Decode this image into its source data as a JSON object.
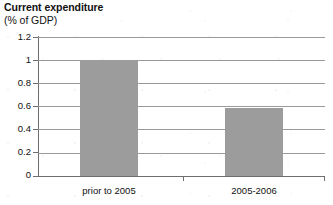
{
  "chart_data": {
    "type": "bar",
    "title": "Current expenditure",
    "subtitle": "(% of GDP)",
    "xlabel": "",
    "ylabel": "",
    "categories": [
      "prior to 2005",
      "2005-2006"
    ],
    "values": [
      1.0,
      0.59
    ],
    "series": [
      {
        "name": "Current expenditure (% of GDP)",
        "values": [
          1.0,
          0.59
        ]
      }
    ],
    "ylim": [
      0,
      1.2
    ],
    "ytick_step": 0.2,
    "ytick_labels": [
      "0",
      "0.2",
      "0.4",
      "0.6",
      "0.8",
      "1",
      "1.2"
    ],
    "ytick_values": [
      0,
      0.2,
      0.4,
      0.6,
      0.8,
      1,
      1.2
    ],
    "grid": true,
    "grid_axis": "y",
    "legend": false,
    "legend_position": "none",
    "bar_color": "#9c9c9c",
    "axis_color": "#6e6e6e",
    "gridline_color": "#9a9a9a",
    "text_color": "#111111",
    "background_color": "#ffffff"
  }
}
